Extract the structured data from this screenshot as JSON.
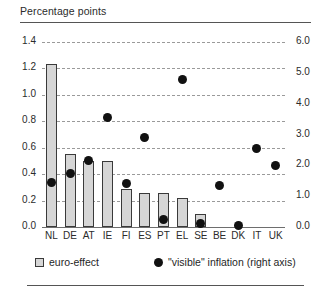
{
  "header": {
    "axis_title": "Percentage points"
  },
  "legend": {
    "items": [
      {
        "label": "euro-effect",
        "marker": "square",
        "color": "#d6d6d6"
      },
      {
        "label": "\"visible\" inflation (right axis)",
        "marker": "circle",
        "color": "#111111"
      }
    ]
  },
  "chart_data": {
    "type": "bar",
    "title": "Percentage points",
    "xlabel": "",
    "ylabel": "Percentage points",
    "grid": true,
    "legend_position": "bottom",
    "categories": [
      "NL",
      "DE",
      "AT",
      "IE",
      "FI",
      "ES",
      "PT",
      "EL",
      "SE",
      "BE",
      "DK",
      "IT",
      "UK"
    ],
    "left_axis": {
      "label": "Percentage points",
      "ylim": [
        0.0,
        1.4
      ],
      "ticks": [
        "0.0",
        "0.2",
        "0.4",
        "0.6",
        "0.8",
        "1.0",
        "1.2",
        "1.4"
      ],
      "tick_values": [
        0.0,
        0.2,
        0.4,
        0.6,
        0.8,
        1.0,
        1.2,
        1.4
      ]
    },
    "right_axis": {
      "label": "right axis",
      "ylim": [
        0.0,
        6.0
      ],
      "ticks": [
        "0.0",
        "1.0",
        "2.0",
        "3.0",
        "4.0",
        "5.0",
        "6.0"
      ],
      "tick_values": [
        0.0,
        1.0,
        2.0,
        3.0,
        4.0,
        5.0,
        6.0
      ]
    },
    "series": [
      {
        "name": "euro-effect",
        "axis": "left",
        "type": "bar",
        "values": [
          1.23,
          0.55,
          0.5,
          0.5,
          0.29,
          0.255,
          0.255,
          0.22,
          0.1,
          null,
          null,
          null,
          null
        ]
      },
      {
        "name": "\"visible\" inflation (right axis)",
        "axis": "right",
        "type": "scatter",
        "values": [
          1.45,
          1.72,
          2.15,
          3.55,
          1.4,
          2.9,
          0.25,
          4.8,
          0.1,
          1.35,
          0.05,
          2.55,
          2.0
        ]
      }
    ]
  }
}
